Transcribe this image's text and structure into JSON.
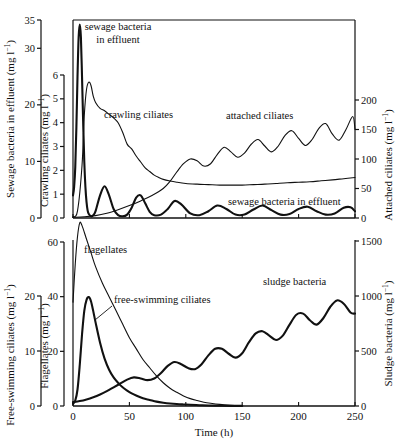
{
  "figure": {
    "caption": "",
    "xlabel": "Time (h)"
  },
  "chart_data": {
    "type": "line",
    "title": "",
    "xlabel": "Time (h)",
    "xlim": [
      0,
      250
    ],
    "xticks": [
      0,
      50,
      100,
      150,
      200,
      250
    ],
    "grid": false,
    "legend_position": "inline-annotations",
    "panels": [
      {
        "id": "top",
        "axes": [
          {
            "id": "sewage-outer",
            "side": "left-outer",
            "label": "Sewage bacteria in effluent (mg l",
            "label_sup": "-1",
            "label_tail": ")",
            "ticks": [
              0,
              10,
              20,
              30,
              35
            ],
            "lim": [
              0,
              35
            ]
          },
          {
            "id": "crawling-inner",
            "side": "left-inner",
            "label": "Crawling ciliates (mg l",
            "label_sup": "-1",
            "label_tail": ")",
            "ticks": [
              0,
              1,
              2,
              3,
              4,
              5,
              6
            ],
            "lim": [
              0,
              6
            ]
          },
          {
            "id": "attached-right",
            "side": "right",
            "label": "Attached ciliates (mg l",
            "label_sup": "-1",
            "label_tail": ")",
            "ticks": [
              0,
              50,
              100,
              150,
              200
            ],
            "lim": [
              0,
              200
            ]
          }
        ],
        "series": [
          {
            "name": "sewage bacteria in effluent",
            "axis": "sewage-outer",
            "units": "mg l-1",
            "stroke_width": 2.1,
            "x": [
              0,
              1,
              2,
              3,
              4,
              5,
              6,
              7,
              8,
              9,
              10,
              11,
              12,
              13,
              14,
              16,
              18,
              20,
              24,
              28,
              32,
              36,
              40,
              44,
              48,
              52,
              56,
              60,
              64,
              68,
              72,
              78,
              84,
              90,
              96,
              104,
              112,
              120,
              128,
              136,
              144,
              152,
              160,
              168,
              176,
              184,
              192,
              200,
              208,
              216,
              224,
              232,
              240,
              246,
              250
            ],
            "y": [
              4.0,
              5.5,
              9.0,
              16.0,
              25.0,
              32.0,
              34.2,
              32.0,
              25.0,
              17.0,
              10.0,
              5.5,
              2.8,
              1.3,
              0.7,
              0.3,
              0.5,
              1.2,
              4.0,
              5.6,
              4.0,
              1.6,
              0.5,
              0.3,
              0.6,
              1.8,
              3.6,
              4.0,
              2.6,
              1.1,
              0.5,
              0.6,
              1.6,
              3.0,
              2.4,
              0.8,
              0.5,
              1.2,
              2.2,
              1.6,
              0.6,
              0.6,
              1.5,
              2.2,
              1.4,
              0.6,
              0.7,
              1.6,
              2.0,
              1.2,
              0.6,
              0.8,
              1.8,
              1.9,
              1.2
            ]
          },
          {
            "name": "crawling ciliates",
            "axis": "crawling-inner",
            "units": "mg l-1",
            "stroke_width": 1.1,
            "x": [
              0,
              4,
              8,
              10,
              12,
              14,
              16,
              18,
              20,
              24,
              28,
              32,
              36,
              40,
              44,
              48,
              52,
              56,
              60,
              64,
              68,
              72,
              76,
              80,
              86,
              92,
              100,
              110,
              120,
              130,
              140,
              150,
              160,
              170,
              180,
              190,
              200,
              210,
              220,
              230,
              240,
              250
            ],
            "y": [
              0.05,
              0.3,
              2.2,
              4.3,
              5.4,
              5.7,
              5.55,
              5.1,
              4.85,
              4.6,
              4.5,
              4.35,
              4.2,
              4.0,
              3.6,
              3.1,
              2.9,
              2.6,
              2.35,
              2.1,
              1.95,
              1.8,
              1.7,
              1.62,
              1.55,
              1.5,
              1.45,
              1.42,
              1.4,
              1.38,
              1.38,
              1.38,
              1.4,
              1.42,
              1.45,
              1.48,
              1.5,
              1.52,
              1.56,
              1.6,
              1.65,
              1.7
            ]
          },
          {
            "name": "attached ciliates",
            "axis": "attached-right",
            "units": "mg l-1",
            "stroke_width": 1.1,
            "x": [
              0,
              10,
              20,
              30,
              40,
              50,
              60,
              70,
              80,
              86,
              92,
              98,
              104,
              110,
              116,
              122,
              128,
              134,
              140,
              146,
              152,
              158,
              164,
              170,
              176,
              182,
              188,
              194,
              200,
              206,
              212,
              218,
              224,
              230,
              236,
              242,
              248,
              250
            ],
            "y": [
              1,
              2,
              4,
              8,
              14,
              21,
              29,
              38,
              50,
              62,
              78,
              92,
              100,
              97,
              88,
              92,
              108,
              120,
              112,
              103,
              110,
              125,
              133,
              122,
              112,
              122,
              140,
              148,
              135,
              123,
              133,
              152,
              160,
              142,
              132,
              150,
              172,
              150
            ]
          }
        ],
        "annotations": [
          {
            "text": "sewage bacteria in effluent",
            "x_px": 88,
            "y_px": 30,
            "align": "start",
            "lines": [
              "sewage bacteria",
              "in effluent"
            ]
          },
          {
            "text": "crawling ciliates",
            "x_px": 104,
            "y_px": 118,
            "align": "start"
          },
          {
            "text": "attached ciliates",
            "x_px": 226,
            "y_px": 119,
            "align": "start"
          },
          {
            "text": "sewage bacteria in effluent",
            "x_px": 228,
            "y_px": 205,
            "align": "start"
          }
        ]
      },
      {
        "id": "bottom",
        "axes": [
          {
            "id": "freeswim-outer",
            "side": "left-outer",
            "label": "Free-swimming ciliates (mg l",
            "label_sup": "-1",
            "label_tail": ")",
            "ticks": [
              0,
              10,
              20
            ],
            "lim": [
              0,
              20
            ]
          },
          {
            "id": "flagellates-inner",
            "side": "left-inner",
            "label": "Flagellates (mg l",
            "label_sup": "-1",
            "label_tail": ")",
            "ticks": [
              0,
              20,
              40,
              60
            ],
            "lim": [
              0,
              60
            ]
          },
          {
            "id": "sludge-right",
            "side": "right",
            "label": "Sludge bacteria (mg l",
            "label_sup": "-1",
            "label_tail": ")",
            "ticks": [
              0,
              500,
              1000,
              1500
            ],
            "lim": [
              0,
              1500
            ]
          }
        ],
        "series": [
          {
            "name": "flagellates",
            "axis": "flagellates-inner",
            "units": "mg l-1",
            "stroke_width": 1.1,
            "x": [
              0,
              2,
              4,
              6,
              8,
              12,
              16,
              20,
              26,
              32,
              38,
              44,
              50,
              56,
              62,
              68,
              74,
              80,
              86,
              92,
              98,
              104,
              110,
              116,
              122,
              130,
              140,
              150
            ],
            "y": [
              38,
              52,
              62,
              67,
              66,
              61,
              56,
              51,
              45,
              40,
              35,
              30,
              25,
              21,
              17,
              14,
              11,
              8.5,
              6.5,
              5.0,
              3.7,
              2.7,
              2.0,
              1.4,
              1.0,
              0.6,
              0.3,
              0.1
            ]
          },
          {
            "name": "free-swimming ciliates",
            "axis": "freeswim-outer",
            "units": "mg l-1",
            "stroke_width": 2.1,
            "x": [
              0,
              2,
              4,
              6,
              8,
              10,
              12,
              14,
              16,
              18,
              20,
              24,
              28,
              32,
              36,
              40,
              44,
              48,
              52,
              56,
              62,
              68,
              74,
              80,
              86,
              92,
              98,
              104,
              112,
              120,
              130,
              140,
              150
            ],
            "y": [
              0.4,
              1.0,
              3.0,
              7.5,
              13.0,
              17.3,
              19.3,
              19.8,
              19.0,
              17.2,
              15.2,
              11.5,
              8.6,
              6.6,
              5.2,
              4.2,
              3.4,
              2.8,
              2.3,
              1.9,
              1.4,
              1.1,
              0.8,
              0.6,
              0.45,
              0.35,
              0.28,
              0.22,
              0.15,
              0.1,
              0.06,
              0.03,
              0.02
            ]
          },
          {
            "name": "sludge bacteria",
            "axis": "sludge-right",
            "units": "mg l-1",
            "stroke_width": 2.1,
            "x": [
              0,
              6,
              12,
              18,
              24,
              30,
              36,
              42,
              48,
              54,
              60,
              66,
              72,
              78,
              84,
              90,
              96,
              102,
              108,
              114,
              120,
              126,
              132,
              138,
              144,
              150,
              156,
              162,
              168,
              174,
              180,
              186,
              192,
              198,
              204,
              210,
              216,
              222,
              228,
              234,
              240,
              246,
              250
            ],
            "y": [
              35,
              45,
              60,
              80,
              105,
              135,
              170,
              205,
              240,
              260,
              250,
              235,
              250,
              300,
              365,
              400,
              380,
              345,
              335,
              380,
              460,
              520,
              520,
              475,
              440,
              480,
              580,
              660,
              680,
              640,
              600,
              640,
              740,
              830,
              840,
              780,
              740,
              800,
              900,
              960,
              930,
              850,
              840
            ]
          }
        ],
        "annotations": [
          {
            "text": "flagellates",
            "x_px": 84,
            "y_px": 253,
            "align": "start"
          },
          {
            "text": "free-swimming ciliates",
            "x_px": 114,
            "y_px": 303,
            "align": "start"
          },
          {
            "text": "sludge bacteria",
            "x_px": 263,
            "y_px": 285,
            "align": "start"
          }
        ]
      }
    ]
  },
  "colors": {
    "ink": "#111111",
    "background": "#ffffff"
  }
}
